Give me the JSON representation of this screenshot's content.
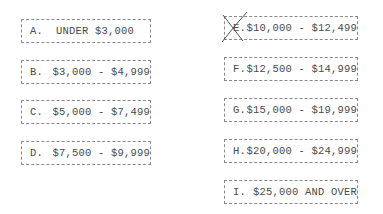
{
  "options": [
    {
      "letter": "A.",
      "label": "UNDER $3,000",
      "crossed": false
    },
    {
      "letter": "B.",
      "label": "$3,000 - $4,999",
      "crossed": false
    },
    {
      "letter": "C.",
      "label": "$5,000 - $7,499",
      "crossed": false
    },
    {
      "letter": "D.",
      "label": "$7,500 - $9,999",
      "crossed": false
    },
    {
      "letter": "E.",
      "label": "$10,000 - $12,499",
      "crossed": true
    },
    {
      "letter": "F.",
      "label": "$12,500 - $14,999",
      "crossed": false
    },
    {
      "letter": "G.",
      "label": "$15,000 - $19,999",
      "crossed": false
    },
    {
      "letter": "H.",
      "label": "$20,000 - $24,999",
      "crossed": false
    },
    {
      "letter": "I.",
      "label": "$25,000 AND OVER",
      "crossed": false
    }
  ],
  "selected_option": "E"
}
